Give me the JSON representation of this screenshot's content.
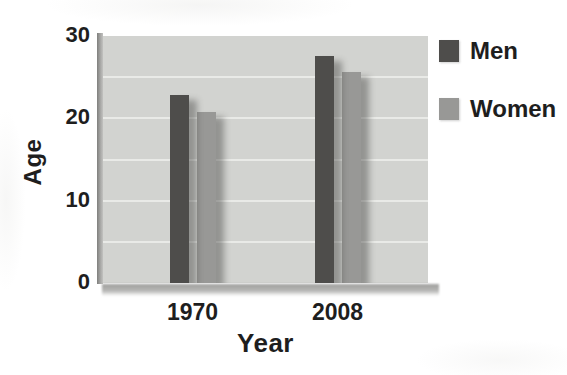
{
  "chart_data": {
    "type": "bar",
    "title": "",
    "categories": [
      "1970",
      "2008"
    ],
    "series": [
      {
        "name": "Men",
        "values": [
          22.8,
          27.6
        ],
        "color": "#4e4d4b"
      },
      {
        "name": "Women",
        "values": [
          20.8,
          25.6
        ],
        "color": "#989896"
      }
    ],
    "xlabel": "Year",
    "ylabel": "Age",
    "ylim": [
      0,
      30
    ],
    "ytick_values": [
      30,
      20,
      10,
      0
    ],
    "gridline_values": [
      5,
      10,
      15,
      20,
      25
    ],
    "grid": true,
    "legend_position": "right-outside",
    "plot_background": "#d2d3d0",
    "gridline_color": "#e9eae7",
    "text_color": "#1e1e1e"
  }
}
